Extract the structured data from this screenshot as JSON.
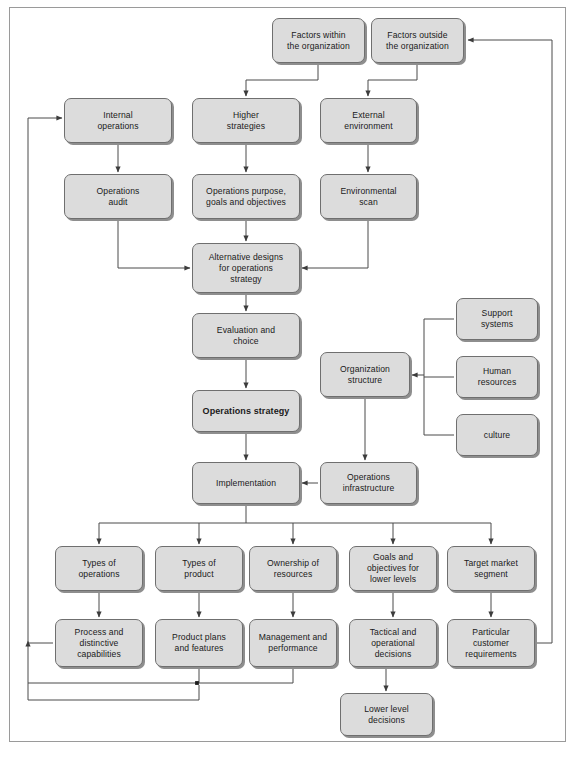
{
  "diagram": {
    "style": {
      "node_fill": "#dcdcdc",
      "node_border": "#6f6f6f",
      "node_shadow": "#8e8e8e",
      "frame_border": "#9a9a9a",
      "connector_color": "#4a4a4a",
      "background": "#ffffff"
    },
    "nodes": [
      {
        "id": "factors_within",
        "label": "Factors within\nthe organization",
        "x": 272,
        "y": 18,
        "w": 93,
        "h": 45
      },
      {
        "id": "factors_outside",
        "label": "Factors outside\nthe organization",
        "x": 371,
        "y": 18,
        "w": 93,
        "h": 45
      },
      {
        "id": "internal_ops",
        "label": "Internal\noperations",
        "x": 64,
        "y": 98,
        "w": 108,
        "h": 45
      },
      {
        "id": "higher_strategies",
        "label": "Higher\nstrategies",
        "x": 192,
        "y": 98,
        "w": 108,
        "h": 45
      },
      {
        "id": "external_env",
        "label": "External\nenvironment",
        "x": 320,
        "y": 98,
        "w": 97,
        "h": 45
      },
      {
        "id": "ops_audit",
        "label": "Operations\naudit",
        "x": 64,
        "y": 174,
        "w": 108,
        "h": 45
      },
      {
        "id": "ops_purpose",
        "label": "Operations purpose,\ngoals and objectives",
        "x": 192,
        "y": 174,
        "w": 108,
        "h": 45
      },
      {
        "id": "env_scan",
        "label": "Environmental\nscan",
        "x": 320,
        "y": 174,
        "w": 97,
        "h": 45
      },
      {
        "id": "alt_designs",
        "label": "Alternative designs\nfor operations\nstrategy",
        "x": 192,
        "y": 243,
        "w": 108,
        "h": 50
      },
      {
        "id": "evaluation",
        "label": "Evaluation and\nchoice",
        "x": 192,
        "y": 313,
        "w": 108,
        "h": 45
      },
      {
        "id": "ops_strategy",
        "label": "Operations strategy",
        "x": 192,
        "y": 390,
        "w": 108,
        "h": 42,
        "bold": true
      },
      {
        "id": "org_structure",
        "label": "Organization\nstructure",
        "x": 320,
        "y": 352,
        "w": 90,
        "h": 45
      },
      {
        "id": "support_systems",
        "label": "Support\nsystems",
        "x": 456,
        "y": 298,
        "w": 82,
        "h": 42
      },
      {
        "id": "human_resources",
        "label": "Human\nresources",
        "x": 456,
        "y": 356,
        "w": 82,
        "h": 42
      },
      {
        "id": "culture",
        "label": "culture",
        "x": 456,
        "y": 414,
        "w": 82,
        "h": 42
      },
      {
        "id": "implementation",
        "label": "Implementation",
        "x": 192,
        "y": 462,
        "w": 108,
        "h": 42
      },
      {
        "id": "ops_infra",
        "label": "Operations\ninfrastructure",
        "x": 320,
        "y": 462,
        "w": 97,
        "h": 42
      },
      {
        "id": "types_ops",
        "label": "Types of\noperations",
        "x": 55,
        "y": 546,
        "w": 88,
        "h": 45
      },
      {
        "id": "types_product",
        "label": "Types of\nproduct",
        "x": 155,
        "y": 546,
        "w": 88,
        "h": 45
      },
      {
        "id": "ownership",
        "label": "Ownership of\nresources",
        "x": 249,
        "y": 546,
        "w": 88,
        "h": 45
      },
      {
        "id": "goals_lower",
        "label": "Goals and\nobjectives for\nlower levels",
        "x": 349,
        "y": 546,
        "w": 88,
        "h": 45
      },
      {
        "id": "target_market",
        "label": "Target market\nsegment",
        "x": 447,
        "y": 546,
        "w": 88,
        "h": 45
      },
      {
        "id": "process_cap",
        "label": "Process and\ndistinctive\ncapabilities",
        "x": 55,
        "y": 619,
        "w": 88,
        "h": 48
      },
      {
        "id": "product_plans",
        "label": "Product plans\nand features",
        "x": 155,
        "y": 619,
        "w": 88,
        "h": 48
      },
      {
        "id": "mgmt_perf",
        "label": "Management and\nperformance",
        "x": 249,
        "y": 619,
        "w": 88,
        "h": 48
      },
      {
        "id": "tactical_dec",
        "label": "Tactical and\noperational\ndecisions",
        "x": 349,
        "y": 619,
        "w": 88,
        "h": 48
      },
      {
        "id": "particular_cust",
        "label": "Particular\ncustomer\nrequirements",
        "x": 447,
        "y": 619,
        "w": 88,
        "h": 48
      },
      {
        "id": "lower_level",
        "label": "Lower level\ndecisions",
        "x": 340,
        "y": 693,
        "w": 93,
        "h": 43
      }
    ],
    "connectors": [
      {
        "from": "factors_within",
        "to": "higher_strategies",
        "kind": "arrow"
      },
      {
        "from": "factors_outside",
        "to": "external_env",
        "kind": "arrow"
      },
      {
        "from": "internal_ops",
        "to": "ops_audit",
        "kind": "arrow"
      },
      {
        "from": "higher_strategies",
        "to": "ops_purpose",
        "kind": "arrow"
      },
      {
        "from": "external_env",
        "to": "env_scan",
        "kind": "arrow"
      },
      {
        "from": "ops_audit",
        "to": "alt_designs",
        "kind": "arrow"
      },
      {
        "from": "ops_purpose",
        "to": "alt_designs",
        "kind": "arrow"
      },
      {
        "from": "env_scan",
        "to": "alt_designs",
        "kind": "arrow"
      },
      {
        "from": "alt_designs",
        "to": "evaluation",
        "kind": "arrow"
      },
      {
        "from": "evaluation",
        "to": "ops_strategy",
        "kind": "arrow"
      },
      {
        "from": "ops_strategy",
        "to": "implementation",
        "kind": "arrow"
      },
      {
        "from": "support_systems",
        "to": "org_structure",
        "kind": "arrow"
      },
      {
        "from": "human_resources",
        "to": "org_structure",
        "kind": "arrow"
      },
      {
        "from": "culture",
        "to": "org_structure",
        "kind": "arrow"
      },
      {
        "from": "org_structure",
        "to": "ops_infra",
        "kind": "arrow"
      },
      {
        "from": "ops_infra",
        "to": "implementation",
        "kind": "arrow"
      },
      {
        "from": "implementation",
        "to": "types_ops",
        "kind": "arrow"
      },
      {
        "from": "implementation",
        "to": "types_product",
        "kind": "arrow"
      },
      {
        "from": "implementation",
        "to": "ownership",
        "kind": "arrow"
      },
      {
        "from": "implementation",
        "to": "goals_lower",
        "kind": "arrow"
      },
      {
        "from": "implementation",
        "to": "target_market",
        "kind": "arrow"
      },
      {
        "from": "types_ops",
        "to": "process_cap",
        "kind": "arrow"
      },
      {
        "from": "types_product",
        "to": "product_plans",
        "kind": "arrow"
      },
      {
        "from": "ownership",
        "to": "mgmt_perf",
        "kind": "arrow"
      },
      {
        "from": "goals_lower",
        "to": "tactical_dec",
        "kind": "arrow"
      },
      {
        "from": "target_market",
        "to": "particular_cust",
        "kind": "arrow"
      },
      {
        "from": "tactical_dec",
        "to": "lower_level",
        "kind": "arrow"
      },
      {
        "from": "process_cap",
        "to": "internal_ops",
        "kind": "feedback-left"
      },
      {
        "from": "particular_cust",
        "to": "factors_outside",
        "kind": "feedback-right"
      },
      {
        "from": "product_plans",
        "to": "process_cap_loop",
        "kind": "feedback-bottom"
      },
      {
        "from": "mgmt_perf",
        "to": "process_cap_loop",
        "kind": "feedback-bottom"
      }
    ]
  }
}
